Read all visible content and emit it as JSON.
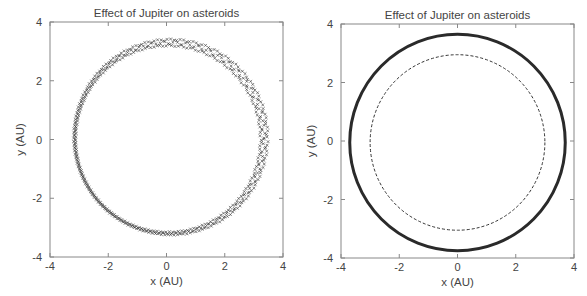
{
  "top_cut_text": "(partially cut-off text at top edge)",
  "chart_data": [
    {
      "type": "scatter",
      "title": "Effect of Jupiter on asteroids",
      "xlabel": "x (AU)",
      "ylabel": "y (AU)",
      "xlim": [
        -4,
        4
      ],
      "ylim": [
        -4,
        4
      ],
      "xticks": [
        "-4",
        "-2",
        "0",
        "2",
        "4"
      ],
      "yticks": [
        "-4",
        "-2",
        "0",
        "2",
        "4"
      ],
      "grid": false,
      "legend": null,
      "series": [
        {
          "name": "asteroid orbit (perturbed, wobbling band)",
          "shape": "circle",
          "center": [
            0.1,
            0.05
          ],
          "radius": 3.25,
          "band_width": 0.15,
          "marker": "x"
        }
      ]
    },
    {
      "type": "scatter",
      "title": "Effect of Jupiter on asteroids",
      "xlabel": "x (AU)",
      "ylabel": "y (AU)",
      "xlim": [
        -4,
        4
      ],
      "ylim": [
        -4,
        4
      ],
      "xticks": [
        "-4",
        "-2",
        "0",
        "2",
        "4"
      ],
      "yticks": [
        "-4",
        "-2",
        "0",
        "2",
        "4"
      ],
      "grid": false,
      "legend": null,
      "series": [
        {
          "name": "outer orbit (solid band)",
          "shape": "circle",
          "center": [
            0,
            -0.05
          ],
          "radius": 3.7,
          "style": "solid-thick"
        },
        {
          "name": "inner orbit (dashed)",
          "shape": "circle",
          "center": [
            0,
            -0.05
          ],
          "radius": 3.0,
          "style": "dashed"
        }
      ]
    }
  ]
}
